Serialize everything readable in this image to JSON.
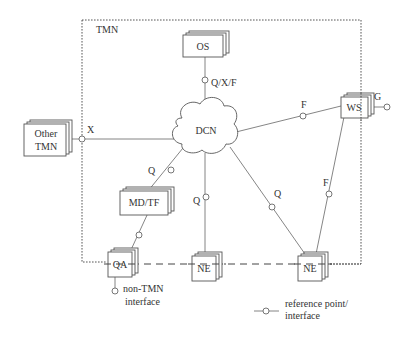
{
  "diagram": {
    "boundary_label": "TMN",
    "nodes": {
      "os": {
        "label": "OS"
      },
      "dcn": {
        "label": "DCN"
      },
      "other_tmn": {
        "line1": "Other",
        "line2": "TMN"
      },
      "ws": {
        "label": "WS"
      },
      "md_tf": {
        "label": "MD/TF"
      },
      "qa": {
        "label": "QA"
      },
      "ne_middle": {
        "label": "NE"
      },
      "ne_right": {
        "label": "NE"
      }
    },
    "reference_points": {
      "os_dcn": "Q/X/F",
      "other_tmn_dcn": "X",
      "ws_dcn": "F",
      "ws_external": "G",
      "md_dcn": "Q",
      "ne_middle_dcn": "Q",
      "ne_right_dcn": "Q",
      "ws_ne": "F"
    },
    "non_tmn": {
      "line1": "non-TMN",
      "line2": "interface"
    },
    "legend": {
      "line1": "reference point/",
      "line2": "interface"
    }
  }
}
